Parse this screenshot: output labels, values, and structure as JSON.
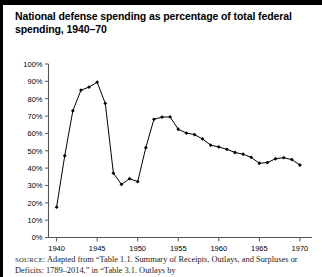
{
  "figure": {
    "title": "National defense spending as percentage of total federal spending, 1940–70",
    "source_prefix": "SOURCE",
    "source_text": ": Adapted from “Table 1.1. Summary of Receipts, Outlays, and",
    "source_text_line2": "Surpluses or Deficits: 1789–2014,” in “Table 3.1. Outlays by"
  },
  "chart_data": {
    "type": "line",
    "title": "National defense spending as percentage of total federal spending, 1940–70",
    "xlabel": "",
    "ylabel": "",
    "xlim": [
      1939,
      1971
    ],
    "ylim": [
      0,
      100
    ],
    "grid": false,
    "legend": false,
    "xticks": [
      1940,
      1945,
      1950,
      1955,
      1960,
      1965,
      1970
    ],
    "xticklabels": [
      "1940",
      "1945",
      "1950",
      "1955",
      "1960",
      "1965",
      "1970"
    ],
    "yticks": [
      0,
      10,
      20,
      30,
      40,
      50,
      60,
      70,
      80,
      90,
      100
    ],
    "yticklabels": [
      "0%",
      "10%",
      "20%",
      "30%",
      "40%",
      "50%",
      "60%",
      "70%",
      "80%",
      "90%",
      "100%"
    ],
    "marker": "diamond",
    "line_color": "#000000",
    "x": [
      1940,
      1941,
      1942,
      1943,
      1944,
      1945,
      1946,
      1947,
      1948,
      1949,
      1950,
      1951,
      1952,
      1953,
      1954,
      1955,
      1956,
      1957,
      1958,
      1959,
      1960,
      1961,
      1962,
      1963,
      1964,
      1965,
      1966,
      1967,
      1968,
      1969,
      1970
    ],
    "values": [
      17.5,
      47.1,
      73.0,
      84.9,
      86.7,
      89.5,
      77.3,
      37.1,
      30.6,
      33.9,
      32.2,
      51.8,
      68.1,
      69.4,
      69.5,
      62.4,
      60.2,
      59.3,
      56.8,
      53.2,
      52.2,
      50.8,
      49.0,
      48.0,
      46.2,
      42.8,
      43.2,
      45.4,
      46.0,
      44.9,
      41.8
    ]
  }
}
